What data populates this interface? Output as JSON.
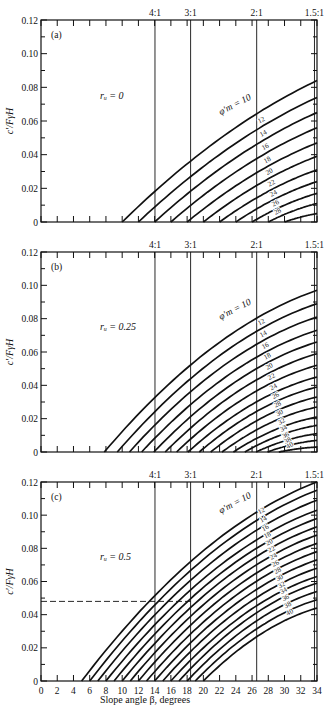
{
  "figure": {
    "xlabel": "Slope angle β, degrees",
    "ylabel": "c′/FγH",
    "x_ticks": [
      "0",
      "2",
      "4",
      "6",
      "8",
      "10",
      "12",
      "14",
      "16",
      "18",
      "20",
      "22",
      "24",
      "26",
      "28",
      "30",
      "32",
      "34"
    ],
    "y_ticks": [
      "0",
      "0.02",
      "0.04",
      "0.06",
      "0.08",
      "0.10",
      "0.12"
    ],
    "slope_ratio_labels": [
      "4:1",
      "3:1",
      "2:1",
      "1.5:1"
    ],
    "curve_family_label": "φ′m = 10"
  },
  "chart_data": [
    {
      "type": "line",
      "panel": "(a)",
      "annotation": "ru = 0",
      "xlabel": "Slope angle β, degrees",
      "ylabel": "c′/FγH",
      "xlim": [
        0,
        34
      ],
      "ylim": [
        0,
        0.12
      ],
      "vertical_reference_lines": [
        {
          "label": "4:1",
          "x": 14.04
        },
        {
          "label": "3:1",
          "x": 18.43
        },
        {
          "label": "2:1",
          "x": 26.57
        },
        {
          "label": "1.5:1",
          "x": 33.69
        }
      ],
      "series": [
        {
          "name": "φ′m = 10",
          "x0": 10.0,
          "y_end": 0.084
        },
        {
          "name": "12",
          "x0": 12.0,
          "y_end": 0.074
        },
        {
          "name": "14",
          "x0": 14.0,
          "y_end": 0.065
        },
        {
          "name": "16",
          "x0": 16.0,
          "y_end": 0.056
        },
        {
          "name": "18",
          "x0": 18.0,
          "y_end": 0.047
        },
        {
          "name": "20",
          "x0": 20.0,
          "y_end": 0.039
        },
        {
          "name": "22",
          "x0": 22.0,
          "y_end": 0.031
        },
        {
          "name": "24",
          "x0": 24.0,
          "y_end": 0.024
        },
        {
          "name": "26",
          "x0": 26.0,
          "y_end": 0.017
        },
        {
          "name": "28",
          "x0": 28.0,
          "y_end": 0.011
        },
        {
          "name": "30",
          "x0": 30.0,
          "y_end": 0.005
        }
      ]
    },
    {
      "type": "line",
      "panel": "(b)",
      "annotation": "ru = 0.25",
      "xlabel": "Slope angle β, degrees",
      "ylabel": "c′/FγH",
      "xlim": [
        0,
        34
      ],
      "ylim": [
        0,
        0.12
      ],
      "vertical_reference_lines": [
        {
          "label": "4:1",
          "x": 14.04
        },
        {
          "label": "3:1",
          "x": 18.43
        },
        {
          "label": "2:1",
          "x": 26.57
        },
        {
          "label": "1.5:1",
          "x": 33.69
        }
      ],
      "series": [
        {
          "name": "φ′m = 10",
          "x0": 7.8,
          "y_end": 0.097
        },
        {
          "name": "12",
          "x0": 9.4,
          "y_end": 0.089
        },
        {
          "name": "14",
          "x0": 10.9,
          "y_end": 0.081
        },
        {
          "name": "16",
          "x0": 12.4,
          "y_end": 0.073
        },
        {
          "name": "18",
          "x0": 13.9,
          "y_end": 0.066
        },
        {
          "name": "20",
          "x0": 15.3,
          "y_end": 0.059
        },
        {
          "name": "22",
          "x0": 16.7,
          "y_end": 0.052
        },
        {
          "name": "24",
          "x0": 18.1,
          "y_end": 0.045
        },
        {
          "name": "26",
          "x0": 19.5,
          "y_end": 0.039
        },
        {
          "name": "28",
          "x0": 20.9,
          "y_end": 0.033
        },
        {
          "name": "30",
          "x0": 22.3,
          "y_end": 0.027
        },
        {
          "name": "32",
          "x0": 23.7,
          "y_end": 0.021
        },
        {
          "name": "34",
          "x0": 25.1,
          "y_end": 0.016
        },
        {
          "name": "36",
          "x0": 26.5,
          "y_end": 0.011
        },
        {
          "name": "38",
          "x0": 27.9,
          "y_end": 0.007
        },
        {
          "name": "40",
          "x0": 29.3,
          "y_end": 0.003
        }
      ]
    },
    {
      "type": "line",
      "panel": "(c)",
      "annotation": "ru = 0.5",
      "xlabel": "Slope angle β, degrees",
      "ylabel": "c′/FγH",
      "xlim": [
        0,
        34
      ],
      "ylim": [
        0,
        0.12
      ],
      "vertical_reference_lines": [
        {
          "label": "4:1",
          "x": 14.04
        },
        {
          "label": "3:1",
          "x": 18.43
        },
        {
          "label": "2:1",
          "x": 26.57
        },
        {
          "label": "1.5:1",
          "x": 33.69
        }
      ],
      "dashed_reference": {
        "y": 0.048,
        "x_end": 18.43
      },
      "series": [
        {
          "name": "φ′m = 10",
          "x0": 5.0,
          "y_end": 0.12
        },
        {
          "name": "12",
          "x0": 6.0,
          "y_end": 0.115
        },
        {
          "name": "14",
          "x0": 7.0,
          "y_end": 0.109
        },
        {
          "name": "16",
          "x0": 8.0,
          "y_end": 0.103
        },
        {
          "name": "18",
          "x0": 9.0,
          "y_end": 0.098
        },
        {
          "name": "20",
          "x0": 10.0,
          "y_end": 0.093
        },
        {
          "name": "22",
          "x0": 11.0,
          "y_end": 0.088
        },
        {
          "name": "24",
          "x0": 12.0,
          "y_end": 0.083
        },
        {
          "name": "26",
          "x0": 13.0,
          "y_end": 0.078
        },
        {
          "name": "28",
          "x0": 14.0,
          "y_end": 0.073
        },
        {
          "name": "30",
          "x0": 15.0,
          "y_end": 0.068
        },
        {
          "name": "32",
          "x0": 16.0,
          "y_end": 0.063
        },
        {
          "name": "34",
          "x0": 17.0,
          "y_end": 0.059
        },
        {
          "name": "36",
          "x0": 18.0,
          "y_end": 0.054
        },
        {
          "name": "38",
          "x0": 19.0,
          "y_end": 0.049
        },
        {
          "name": "40",
          "x0": 20.0,
          "y_end": 0.044
        }
      ]
    }
  ]
}
